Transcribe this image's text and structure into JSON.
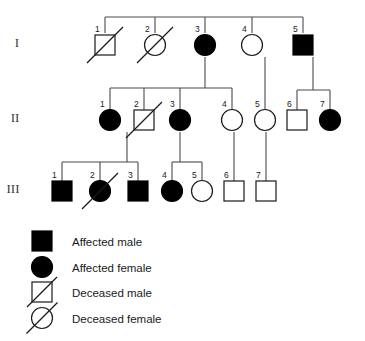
{
  "diagram": {
    "type": "pedigree-chart",
    "title": "",
    "background_color": "#ffffff",
    "line_color": "#4a4a4a",
    "symbol_stroke_color": "#1a1a1a",
    "affected_fill_color": "#000000",
    "unaffected_fill_color": "#ffffff"
  },
  "generations": [
    {
      "id": "I",
      "label": "I",
      "label_x": 17,
      "label_y": 47,
      "row_y": 45
    },
    {
      "id": "II",
      "label": "II",
      "label_x": 15,
      "label_y": 122,
      "row_y": 120
    },
    {
      "id": "III",
      "label": "III",
      "label_x": 13,
      "label_y": 193,
      "row_y": 191
    }
  ],
  "individuals": [
    {
      "name": "I-1",
      "generation": "I",
      "number": "1",
      "sex": "male",
      "affected": false,
      "deceased": true,
      "x": 105,
      "y": 45,
      "num_x": 95,
      "num_y": 32
    },
    {
      "name": "I-2",
      "generation": "I",
      "number": "2",
      "sex": "female",
      "affected": false,
      "deceased": true,
      "x": 155,
      "y": 45,
      "num_x": 145,
      "num_y": 32
    },
    {
      "name": "I-3",
      "generation": "I",
      "number": "3",
      "sex": "female",
      "affected": true,
      "deceased": false,
      "x": 205,
      "y": 45,
      "num_x": 195,
      "num_y": 32
    },
    {
      "name": "I-4",
      "generation": "I",
      "number": "4",
      "sex": "female",
      "affected": false,
      "deceased": false,
      "x": 252,
      "y": 45,
      "num_x": 242,
      "num_y": 32
    },
    {
      "name": "I-5",
      "generation": "I",
      "number": "5",
      "sex": "male",
      "affected": true,
      "deceased": false,
      "x": 303,
      "y": 45,
      "num_x": 293,
      "num_y": 32
    },
    {
      "name": "II-1",
      "generation": "II",
      "number": "1",
      "sex": "female",
      "affected": true,
      "deceased": false,
      "x": 110,
      "y": 120,
      "num_x": 100,
      "num_y": 107
    },
    {
      "name": "II-2",
      "generation": "II",
      "number": "2",
      "sex": "male",
      "affected": false,
      "deceased": true,
      "x": 144,
      "y": 120,
      "num_x": 134,
      "num_y": 107
    },
    {
      "name": "II-3",
      "generation": "II",
      "number": "3",
      "sex": "female",
      "affected": true,
      "deceased": false,
      "x": 180,
      "y": 120,
      "num_x": 170,
      "num_y": 107
    },
    {
      "name": "II-4",
      "generation": "II",
      "number": "4",
      "sex": "female",
      "affected": false,
      "deceased": false,
      "x": 232,
      "y": 120,
      "num_x": 222,
      "num_y": 107
    },
    {
      "name": "II-5",
      "generation": "II",
      "number": "5",
      "sex": "female",
      "affected": false,
      "deceased": false,
      "x": 265,
      "y": 120,
      "num_x": 255,
      "num_y": 107
    },
    {
      "name": "II-6",
      "generation": "II",
      "number": "6",
      "sex": "male",
      "affected": false,
      "deceased": false,
      "x": 297,
      "y": 120,
      "num_x": 287,
      "num_y": 107
    },
    {
      "name": "II-7",
      "generation": "II",
      "number": "7",
      "sex": "female",
      "affected": true,
      "deceased": false,
      "x": 330,
      "y": 120,
      "num_x": 320,
      "num_y": 107
    },
    {
      "name": "III-1",
      "generation": "III",
      "number": "1",
      "sex": "male",
      "affected": true,
      "deceased": false,
      "x": 62,
      "y": 191,
      "num_x": 52,
      "num_y": 178
    },
    {
      "name": "III-2",
      "generation": "III",
      "number": "2",
      "sex": "female",
      "affected": true,
      "deceased": true,
      "x": 100,
      "y": 191,
      "num_x": 90,
      "num_y": 178
    },
    {
      "name": "III-3",
      "generation": "III",
      "number": "3",
      "sex": "male",
      "affected": true,
      "deceased": false,
      "x": 138,
      "y": 191,
      "num_x": 128,
      "num_y": 178
    },
    {
      "name": "III-4",
      "generation": "III",
      "number": "4",
      "sex": "female",
      "affected": true,
      "deceased": false,
      "x": 172,
      "y": 191,
      "num_x": 162,
      "num_y": 178
    },
    {
      "name": "III-5",
      "generation": "III",
      "number": "5",
      "sex": "female",
      "affected": false,
      "deceased": false,
      "x": 202,
      "y": 191,
      "num_x": 192,
      "num_y": 178
    },
    {
      "name": "III-6",
      "generation": "III",
      "number": "6",
      "sex": "male",
      "affected": false,
      "deceased": false,
      "x": 234,
      "y": 191,
      "num_x": 224,
      "num_y": 178
    },
    {
      "name": "III-7",
      "generation": "III",
      "number": "7",
      "sex": "male",
      "affected": false,
      "deceased": false,
      "x": 266,
      "y": 191,
      "num_x": 256,
      "num_y": 178
    }
  ],
  "legend": {
    "items": [
      {
        "name": "legend-affected-male",
        "symbol": "filled-square",
        "label": "Affected male",
        "sym_x": 42,
        "sym_y": 241,
        "text_x": 72,
        "text_y": 246
      },
      {
        "name": "legend-affected-female",
        "symbol": "filled-circle",
        "label": "Affected female",
        "sym_x": 42,
        "sym_y": 267,
        "text_x": 72,
        "text_y": 272
      },
      {
        "name": "legend-deceased-male",
        "symbol": "slashed-square",
        "label": "Deceased male",
        "sym_x": 42,
        "sym_y": 292,
        "text_x": 72,
        "text_y": 297
      },
      {
        "name": "legend-deceased-female",
        "symbol": "slashed-circle",
        "label": "Deceased female",
        "sym_x": 42,
        "sym_y": 318,
        "text_x": 72,
        "text_y": 323
      }
    ]
  },
  "connections": {
    "gen1_partner_line": {
      "name": "generation-i-partner-line",
      "y": 17,
      "x1": 105,
      "x2": 303
    },
    "gen1_drops": [
      {
        "name": "drop-to-i-1",
        "x": 105,
        "y1": 17,
        "y2": 33
      },
      {
        "name": "drop-to-i-2",
        "x": 155,
        "y1": 17,
        "y2": 33
      },
      {
        "name": "drop-to-i-3",
        "x": 205,
        "y1": 17,
        "y2": 33
      },
      {
        "name": "drop-to-i-4",
        "x": 252,
        "y1": 17,
        "y2": 33
      },
      {
        "name": "drop-to-i-5",
        "x": 303,
        "y1": 17,
        "y2": 33
      }
    ],
    "descent_i3": {
      "name": "descent-from-i-3",
      "x": 205,
      "y1": 57,
      "y2": 88
    },
    "sibship_ii_left": {
      "name": "sibship-line-ii-left",
      "y": 88,
      "x1": 110,
      "x2": 232
    },
    "sibship_ii_left_drops": [
      {
        "name": "drop-to-ii-1",
        "x": 110,
        "y1": 88,
        "y2": 110
      },
      {
        "name": "drop-to-ii-2",
        "x": 144,
        "y1": 88,
        "y2": 110
      },
      {
        "name": "drop-to-ii-3",
        "x": 180,
        "y1": 88,
        "y2": 110
      },
      {
        "name": "drop-to-ii-4",
        "x": 232,
        "y1": 88,
        "y2": 110
      }
    ],
    "descent_i4": {
      "name": "descent-from-i-4",
      "x": 265,
      "y1": 57,
      "y2": 110
    },
    "descent_i5": {
      "name": "descent-from-i-5",
      "x": 313,
      "y1": 57,
      "y2": 90
    },
    "sibship_ii_right": {
      "name": "sibship-line-ii-right",
      "y": 90,
      "x1": 297,
      "x2": 330
    },
    "sibship_ii_right_drops": [
      {
        "name": "drop-to-ii-6",
        "x": 297,
        "y1": 90,
        "y2": 112
      },
      {
        "name": "drop-to-ii-7",
        "x": 330,
        "y1": 90,
        "y2": 112
      }
    ],
    "descent_ii_left": {
      "name": "descent-to-sibship-iii-left",
      "x": 127,
      "y1": 132,
      "y2": 162
    },
    "sibship_iii_left": {
      "name": "sibship-line-iii-left",
      "y": 162,
      "x1": 62,
      "x2": 138
    },
    "sibship_iii_left_drops": [
      {
        "name": "drop-to-iii-1",
        "x": 62,
        "y1": 162,
        "y2": 181
      },
      {
        "name": "drop-to-iii-2",
        "x": 100,
        "y1": 162,
        "y2": 181
      },
      {
        "name": "drop-to-iii-3",
        "x": 138,
        "y1": 162,
        "y2": 181
      }
    ],
    "descent_ii3": {
      "name": "descent-from-ii-3",
      "x": 180,
      "y1": 132,
      "y2": 162
    },
    "sibship_iii_mid": {
      "name": "sibship-line-iii-mid",
      "y": 162,
      "x1": 172,
      "x2": 202
    },
    "sibship_iii_mid_drops": [
      {
        "name": "drop-to-iii-4",
        "x": 172,
        "y1": 162,
        "y2": 181
      },
      {
        "name": "drop-to-iii-5",
        "x": 202,
        "y1": 162,
        "y2": 181
      }
    ],
    "direct_ii4_iii6": {
      "name": "descent-ii-4-to-iii-6",
      "x": 234,
      "y1": 132,
      "y2": 181
    },
    "direct_ii5_iii7": {
      "name": "descent-ii-5-to-iii-7",
      "x": 266,
      "y1": 132,
      "y2": 181
    }
  }
}
